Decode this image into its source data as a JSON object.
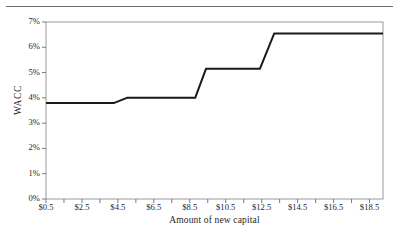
{
  "figure": {
    "rule_present": true
  },
  "chart_data": {
    "type": "line",
    "title": "",
    "xlabel": "Amount of new capital",
    "ylabel": "WACC",
    "xlim": [
      0.5,
      19.25
    ],
    "ylim": [
      0,
      7
    ],
    "grid": false,
    "legend": null,
    "y_tick_labels": [
      "0%",
      "1%",
      "2%",
      "3%",
      "4%",
      "5%",
      "6%",
      "7%"
    ],
    "y_tick_values": [
      0,
      1,
      2,
      3,
      4,
      5,
      6,
      7
    ],
    "x_tick_labels": [
      "$0.5",
      "$2.5",
      "$4.5",
      "$6.5",
      "$8.5",
      "$10.5",
      "$12.5",
      "$14.5",
      "$16.5",
      "$18.5"
    ],
    "x_tick_values": [
      0.5,
      2.5,
      4.5,
      6.5,
      8.5,
      10.5,
      12.5,
      14.5,
      16.5,
      18.5
    ],
    "x_minor_tick_step": 1,
    "series": [
      {
        "name": "WACC",
        "color": "#1a1a1a",
        "line_width": 2,
        "x": [
          0.5,
          4.3,
          5.0,
          8.8,
          9.4,
          12.4,
          13.2,
          19.25
        ],
        "y": [
          3.8,
          3.8,
          4.0,
          4.0,
          5.15,
          5.15,
          6.55,
          6.55
        ]
      }
    ],
    "step_levels": [
      "3.8%",
      "4.0%",
      "5.15%",
      "6.55%"
    ],
    "step_breakpoints": [
      "$4.3",
      "$8.8",
      "$12.4"
    ]
  }
}
